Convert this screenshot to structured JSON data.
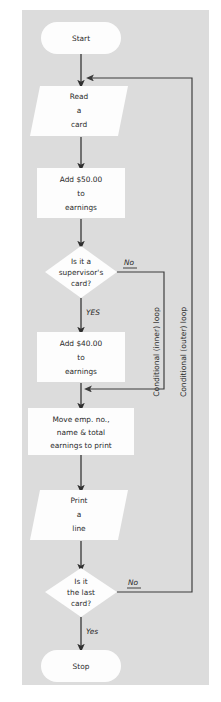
{
  "diagram": {
    "background_color": "#dcdcdc",
    "shape_color": "#fdfdfd",
    "line_color": "#2f2f2f",
    "nodes": [
      {
        "id": "start",
        "type": "terminator",
        "lines": [
          "Start"
        ]
      },
      {
        "id": "read-card",
        "type": "input-output",
        "lines": [
          "Read",
          "a",
          "card"
        ]
      },
      {
        "id": "add-50",
        "type": "process",
        "lines": [
          "Add  $50.00",
          "to",
          "earnings"
        ]
      },
      {
        "id": "is-supervisor",
        "type": "decision",
        "lines": [
          "Is it a",
          "supervisor's",
          "card?"
        ]
      },
      {
        "id": "add-40",
        "type": "process",
        "lines": [
          "Add  $40.00",
          "to",
          "earnings"
        ]
      },
      {
        "id": "move-data",
        "type": "process",
        "lines": [
          "Move emp. no.,",
          "name & total",
          "earnings to print"
        ]
      },
      {
        "id": "print-line",
        "type": "input-output",
        "lines": [
          "Print",
          "a",
          "line"
        ]
      },
      {
        "id": "is-last",
        "type": "decision",
        "lines": [
          "Is it",
          "the last",
          "card?"
        ]
      },
      {
        "id": "stop",
        "type": "terminator",
        "lines": [
          "Stop"
        ]
      }
    ],
    "branch_labels": {
      "supervisor_no": "No",
      "supervisor_yes": "YES",
      "last_no": "No",
      "last_yes": "Yes"
    },
    "loop_labels": {
      "inner": "Conditional (inner) loop",
      "outer": "Conditional (outer) loop"
    }
  }
}
